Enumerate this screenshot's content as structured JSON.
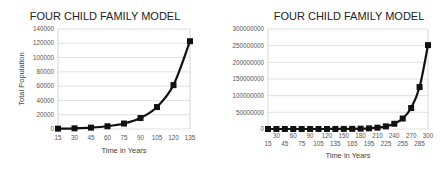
{
  "chart_data": [
    {
      "type": "line",
      "title": "FOUR CHILD FAMILY MODEL",
      "xlabel": "Time in Years",
      "ylabel": "Total Population",
      "x": [
        15,
        30,
        45,
        60,
        75,
        90,
        105,
        120,
        135
      ],
      "series": [
        {
          "name": "Total Population",
          "values": [
            480,
            960,
            1920,
            3840,
            7680,
            15360,
            30720,
            61440,
            122880
          ],
          "color": "#111111",
          "marker": "square"
        }
      ],
      "y_ticks": [
        0,
        20000,
        40000,
        60000,
        80000,
        100000,
        120000,
        140000
      ],
      "y_tick_labels": [
        "0",
        "20000",
        "40000",
        "60000",
        "80000",
        "100000",
        "120000",
        "140000"
      ],
      "ylim": [
        0,
        140000
      ],
      "grid": true,
      "legend": "none"
    },
    {
      "type": "line",
      "title": "FOUR CHILD FAMILY MODEL",
      "xlabel": "Time in Years",
      "ylabel": "Total Population",
      "x": [
        15,
        30,
        45,
        60,
        75,
        90,
        105,
        120,
        135,
        150,
        165,
        180,
        195,
        210,
        225,
        240,
        255,
        270,
        285,
        300
      ],
      "series": [
        {
          "name": "Total Population",
          "values": [
            480,
            960,
            1920,
            3840,
            7680,
            15360,
            30720,
            61440,
            122880,
            245760,
            491520,
            983040,
            1966080,
            3932160,
            7864320,
            15728640,
            31457280,
            62914560,
            125829120,
            251658240
          ],
          "color": "#111111",
          "marker": "square"
        }
      ],
      "y_ticks": [
        0,
        50000000,
        100000000,
        150000000,
        200000000,
        250000000,
        300000000
      ],
      "y_tick_labels": [
        "0",
        "50000000",
        "100000000",
        "150000000",
        "200000000",
        "250000000",
        "300000000"
      ],
      "ylim": [
        0,
        300000000
      ],
      "grid": true,
      "legend": "none"
    }
  ]
}
